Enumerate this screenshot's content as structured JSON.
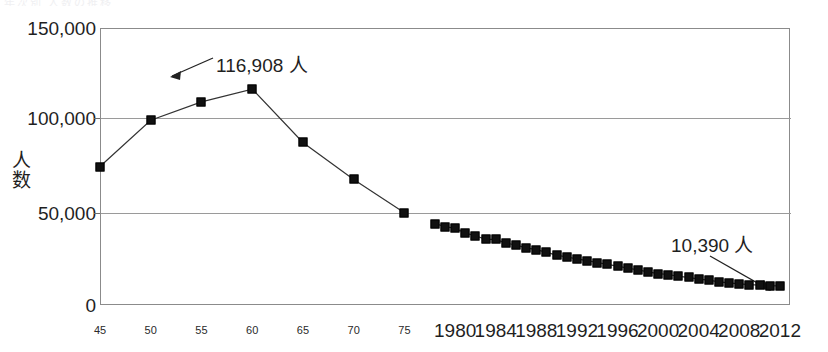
{
  "header": {
    "cut_title": "年次別 人数の推移"
  },
  "chart_data": {
    "type": "line",
    "title": "",
    "xlabel": "",
    "ylabel": "人数",
    "ylim": [
      0,
      150000
    ],
    "ytick_values": [
      0,
      50000,
      100000,
      150000
    ],
    "ytick_labels": [
      "0",
      "50,000",
      "100,000",
      "150,000"
    ],
    "grid": true,
    "legend": "none",
    "xlim": [
      1945,
      2013
    ],
    "xtick_small_labels": [
      "45",
      "50",
      "55",
      "60",
      "65",
      "70",
      "75"
    ],
    "xtick_small_values": [
      1945,
      1950,
      1955,
      1960,
      1965,
      1970,
      1975
    ],
    "xtick_big_labels": [
      "1980",
      "1984",
      "1988",
      "1992",
      "1996",
      "2000",
      "2004",
      "2008",
      "2012"
    ],
    "xtick_big_values": [
      1980,
      1984,
      1988,
      1992,
      1996,
      2000,
      2004,
      2008,
      2012
    ],
    "series": [
      {
        "name": "五年刻み期間",
        "x": [
          1945,
          1950,
          1955,
          1960,
          1965,
          1970,
          1975
        ],
        "values": [
          75000,
          100000,
          110000,
          116908,
          88000,
          68000,
          50000
        ]
      },
      {
        "name": "年次期間",
        "x": [
          1978,
          1979,
          1980,
          1981,
          1982,
          1983,
          1984,
          1985,
          1986,
          1987,
          1988,
          1989,
          1990,
          1991,
          1992,
          1993,
          1994,
          1995,
          1996,
          1997,
          1998,
          1999,
          2000,
          2001,
          2002,
          2003,
          2004,
          2005,
          2006,
          2007,
          2008,
          2009,
          2010,
          2011,
          2012
        ],
        "values": [
          44000,
          42500,
          41500,
          39000,
          37500,
          35500,
          35500,
          33500,
          32500,
          31000,
          30000,
          28500,
          27000,
          26000,
          25000,
          24000,
          23000,
          22000,
          21000,
          20000,
          19000,
          18000,
          17000,
          16500,
          15500,
          15000,
          14000,
          13500,
          12500,
          12000,
          11500,
          11000,
          10800,
          10500,
          10390
        ]
      }
    ],
    "annotations": [
      {
        "id": "peak",
        "label": "116,908 人",
        "value": 116908,
        "at_x": 1960
      },
      {
        "id": "last",
        "label": "10,390 人",
        "value": 10390,
        "at_x": 2012
      }
    ]
  }
}
